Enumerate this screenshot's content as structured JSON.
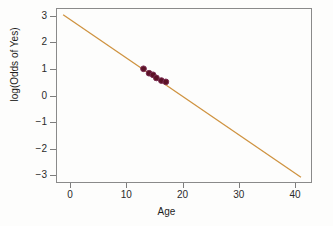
{
  "chart_data": {
    "type": "scatter",
    "title": "",
    "xlabel": "Age",
    "ylabel": "log(Odds of Yes)",
    "xlim": [
      -2.5,
      43
    ],
    "ylim": [
      -3.3,
      3.3
    ],
    "xticks": [
      0,
      10,
      20,
      30,
      40
    ],
    "yticks": [
      3,
      2,
      1,
      0,
      -1,
      -2,
      -3
    ],
    "ytick_labels": [
      "3",
      "2",
      "1",
      "0",
      "−1",
      "−2",
      "−3"
    ],
    "grid": false,
    "legend": "none",
    "series": [
      {
        "name": "observed",
        "type": "scatter",
        "marker": "filled-circle",
        "color": "#5c1226",
        "edge_color": "#7a2d52",
        "x": [
          13.0,
          14.0,
          14.7,
          15.3,
          16.2,
          17.0
        ],
        "y": [
          1.02,
          0.85,
          0.79,
          0.67,
          0.57,
          0.52
        ]
      },
      {
        "name": "fitted-logit-line",
        "type": "line",
        "color": "#cf9340",
        "width": 1.3,
        "x_endpoints": [
          -1.4,
          41.2
        ],
        "y_endpoints": [
          3.08,
          -3.12
        ],
        "slope": -0.1455,
        "intercept": 2.876
      }
    ]
  },
  "axes": {
    "x_title": "Age",
    "y_title": "log(Odds of Yes)",
    "x_tick_labels": [
      "0",
      "10",
      "20",
      "30",
      "40"
    ],
    "y_tick_labels": [
      "3",
      "2",
      "1",
      "0",
      "−1",
      "−2",
      "−3"
    ]
  },
  "colors": {
    "line": "#cf9340",
    "point_fill": "#5c1226",
    "point_edge": "#7a2d52",
    "frame": "#8a8a8a",
    "text": "#1d1d1d",
    "background": "#fdfdfc"
  }
}
